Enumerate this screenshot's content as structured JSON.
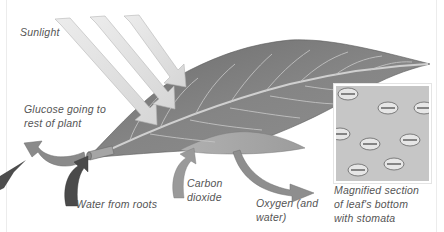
{
  "diagram": {
    "labels": {
      "sunlight": "Sunlight",
      "glucose": [
        "Glucose going to",
        "rest of plant"
      ],
      "water": "Water from roots",
      "carbon_dioxide": [
        "Carbon",
        "dioxide"
      ],
      "oxygen": [
        "Oxygen (and",
        "water)"
      ],
      "inset_caption": [
        "Magnified section",
        "of leaf's bottom",
        "with stomata"
      ]
    },
    "arrows": [
      {
        "name": "sunlight-rays",
        "count": 3,
        "direction": "into leaf top",
        "color": "#e2e2e2"
      },
      {
        "name": "glucose-arrow",
        "direction": "out of stem, to left",
        "color": "#8a8a8a"
      },
      {
        "name": "water-arrow",
        "direction": "up into stem",
        "color": "#4a4a4a"
      },
      {
        "name": "carbon-dioxide-arrow",
        "direction": "up into leaf underside",
        "color": "#9a9a9a"
      },
      {
        "name": "oxygen-arrow",
        "direction": "out of leaf underside, to right",
        "color": "#8e8e8e"
      }
    ],
    "colors": {
      "leaf": "#7d7d7d",
      "leaf_veins": "#c8c8c8",
      "label_text": "#555555",
      "background": "#ffffff"
    }
  }
}
